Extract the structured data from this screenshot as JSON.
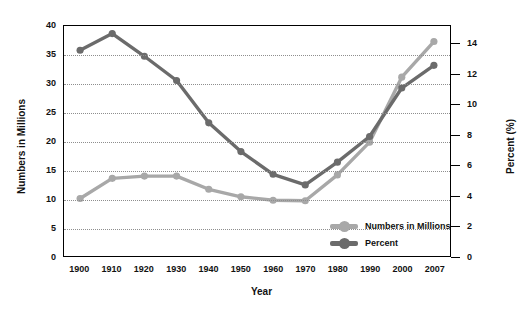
{
  "chart_data": {
    "type": "line",
    "title": "",
    "xlabel": "Year",
    "categories": [
      "1900",
      "1910",
      "1920",
      "1930",
      "1940",
      "1950",
      "1960",
      "1970",
      "1980",
      "1990",
      "2000",
      "2007"
    ],
    "grid": true,
    "legend_position": "inside-bottom-right",
    "axes": {
      "left": {
        "label": "Numbers in Millions",
        "ticks": [
          "40",
          "35",
          "30",
          "25",
          "20",
          "15",
          "10",
          "5",
          "0"
        ],
        "tick_values": [
          40,
          35,
          30,
          25,
          20,
          15,
          10,
          5,
          0
        ],
        "min": 0,
        "max": 40
      },
      "right": {
        "label": "Percent (%)",
        "ticks": [
          "14",
          "12",
          "10",
          "8",
          "6",
          "4",
          "2",
          "0"
        ],
        "tick_values": [
          14,
          12,
          10,
          8,
          6,
          4,
          2,
          0
        ],
        "min": 0,
        "max": 15.2
      }
    },
    "series": [
      {
        "name": "Numbers in Millions",
        "axis": "left",
        "color": "#a8a8a8",
        "values": [
          10.0,
          13.5,
          13.9,
          13.9,
          11.6,
          10.3,
          9.7,
          9.6,
          14.1,
          19.8,
          31.1,
          37.3
        ]
      },
      {
        "name": "Percent",
        "axis": "right",
        "color": "#6b6b6b",
        "values": [
          13.6,
          14.7,
          13.2,
          11.6,
          8.8,
          6.9,
          5.4,
          4.7,
          6.2,
          7.9,
          11.1,
          12.6
        ]
      }
    ]
  },
  "legend": {
    "items": [
      {
        "label": "Numbers in Millions",
        "color": "#a8a8a8"
      },
      {
        "label": "Percent",
        "color": "#6b6b6b"
      }
    ]
  }
}
